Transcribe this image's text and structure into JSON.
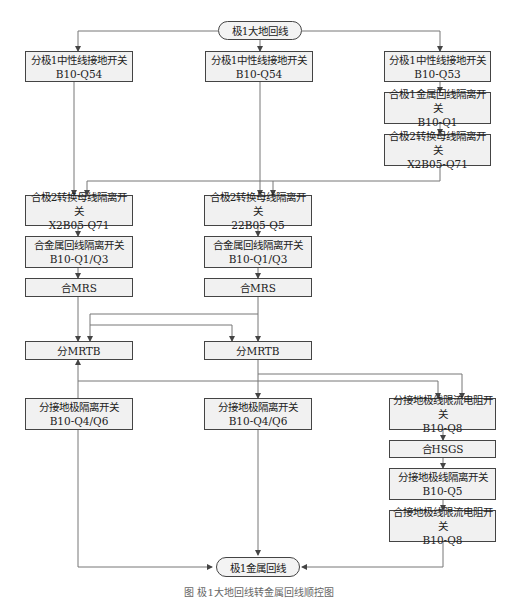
{
  "start": "极1大地回线",
  "end": "极1金属回线",
  "columns": {
    "left": [
      {
        "line1": "分极1中性线接地开关",
        "line2": "B10-Q54"
      },
      {
        "line1": "合极2转换母线隔离开关",
        "line2": "X2B05-Q71"
      },
      {
        "line1": "合金属回线隔离开关",
        "line2": "B10-Q1/Q3"
      },
      {
        "line1": "合MRS",
        "line2": ""
      },
      {
        "line1": "分MRTB",
        "line2": ""
      },
      {
        "line1": "分接地极隔离开关",
        "line2": "B10-Q4/Q6"
      }
    ],
    "middle": [
      {
        "line1": "分极1中性线接地开关",
        "line2": "B10-Q54"
      },
      {
        "line1": "合极2转换母线隔离开关",
        "line2": "22B05-Q5"
      },
      {
        "line1": "合金属回线隔离开关",
        "line2": "B10-Q1/Q3"
      },
      {
        "line1": "合MRS",
        "line2": ""
      },
      {
        "line1": "分MRTB",
        "line2": ""
      },
      {
        "line1": "分接地极隔离开关",
        "line2": "B10-Q4/Q6"
      }
    ],
    "right_top": [
      {
        "line1": "分极1中性线接地开关",
        "line2": "B10-Q53"
      },
      {
        "line1": "合极1金属回线隔离开关",
        "line2": "B10-Q1"
      },
      {
        "line1": "合极2转换母线隔离开关",
        "line2": "X2B05-Q71"
      }
    ],
    "right_bottom": [
      {
        "line1": "分接地极线限流电阻开关",
        "line2": "B10-Q8"
      },
      {
        "line1": "合HSGS",
        "line2": ""
      },
      {
        "line1": "分接地极线隔离开关",
        "line2": "B10-Q5"
      },
      {
        "line1": "合接地极线限流电阻开关",
        "line2": "B10-Q8"
      }
    ]
  },
  "caption": "图 极1大地回线转金属回线顺控图"
}
